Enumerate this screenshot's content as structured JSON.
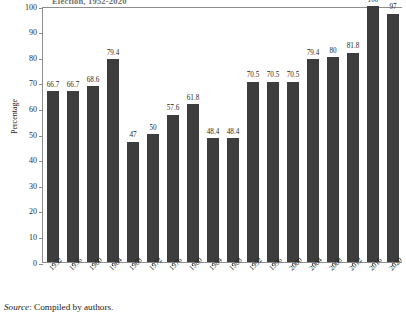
{
  "figure": {
    "title_partial": "Election, 1952-2020",
    "source_prefix": "Source",
    "source_text": ": Compiled by authors.",
    "bar_color": "#3d3d3d",
    "frame_color": "#8d8d8d"
  },
  "chart_data": {
    "type": "bar",
    "title": "Election, 1952-2020",
    "xlabel": "",
    "ylabel": "Percentage",
    "ylim": [
      0,
      100
    ],
    "yticks": [
      0,
      10,
      20,
      30,
      40,
      50,
      60,
      70,
      80,
      90,
      100
    ],
    "grid": false,
    "legend": "none",
    "categories": [
      "1952",
      "1956",
      "1960",
      "1964",
      "1968",
      "1972",
      "1976",
      "1980",
      "1984",
      "1988",
      "1992",
      "1996",
      "2000",
      "2004",
      "2008",
      "2012",
      "2016",
      "2020"
    ],
    "values": [
      66.7,
      66.7,
      68.6,
      79.4,
      47,
      50,
      57.6,
      61.8,
      48.4,
      48.4,
      70.5,
      70.5,
      70.5,
      79.4,
      80,
      81.8,
      100,
      97
    ],
    "value_labels": [
      "66.7",
      "66.7",
      "68.6",
      "79.4",
      "47",
      "50",
      "57.6",
      "61.8",
      "48.4",
      "48.4",
      "70.5",
      "70.5",
      "70.5",
      "79.4",
      "80",
      "81.8",
      "100",
      "97"
    ]
  }
}
